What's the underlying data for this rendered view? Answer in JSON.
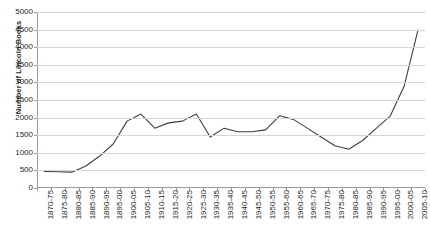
{
  "chart_data": {
    "type": "line",
    "title": "",
    "xlabel": "",
    "ylabel": "Number of Lincoln Books",
    "ylim": [
      0,
      5000
    ],
    "ytick_step": 500,
    "yticks": [
      0,
      500,
      1000,
      1500,
      2000,
      2500,
      3000,
      3500,
      4000,
      4500,
      5000
    ],
    "grid": true,
    "legend": "none",
    "line_color": "#3f3f3f",
    "categories": [
      "1870-75",
      "1875-80",
      "1880-85",
      "1885-90",
      "1890-95",
      "1895-00",
      "1900-05",
      "1905-10",
      "1910-15",
      "1915-20",
      "1920-25",
      "1925-30",
      "1930-35",
      "1935-40",
      "1940-45",
      "1945-50",
      "1950-55",
      "1955-60",
      "1960-65",
      "1965-70",
      "1970-75",
      "1975-80",
      "1980-85",
      "1985-90",
      "1990-95",
      "1995-00",
      "2000-05",
      "2005-10"
    ],
    "values": [
      470,
      460,
      450,
      620,
      900,
      1250,
      1900,
      2100,
      1700,
      1850,
      1900,
      2100,
      1450,
      1700,
      1600,
      1600,
      1650,
      2050,
      1950,
      1700,
      1450,
      1200,
      1100,
      1350,
      1700,
      2050,
      2900,
      4500
    ]
  }
}
